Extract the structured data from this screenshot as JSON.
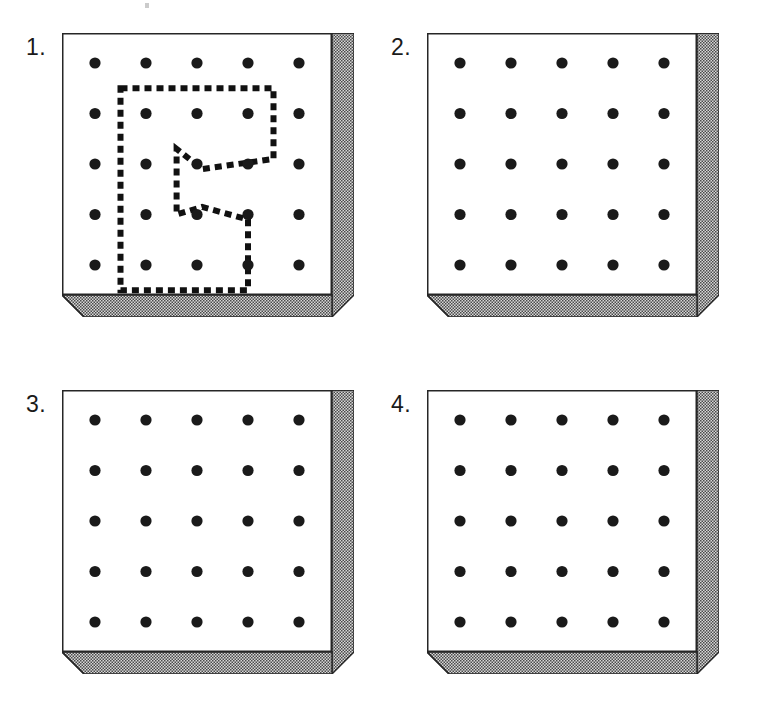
{
  "figure": {
    "kind": "pegboard-panel-set",
    "panel_count": 4,
    "grid": {
      "rows": 5,
      "columns": 5,
      "dot_count": 25,
      "dot_color": "#1a1a1a",
      "dot_radius_px": 5.6,
      "spacing_px": 55
    },
    "colors": {
      "ink": "#1a1a1a",
      "outline": "#262626",
      "face": "#ffffff",
      "edge_fill": "#d7d7d7",
      "edge_stipple": "#4a4a4a",
      "dash": "#111111",
      "speck": "#b9b9b9"
    },
    "board_geometry": {
      "face_width_px": 270,
      "face_height_px": 262,
      "depth_px": 22,
      "right_edge": "stippled parallelogram",
      "bottom_edge": "stippled parallelogram"
    }
  },
  "panels": [
    {
      "id": "panel-1",
      "label": "1.",
      "x": 62,
      "y": 33,
      "has_dashed_outline": true,
      "dashed_outline": {
        "style": "square dotted",
        "dash_length_px": 7,
        "gap_length_px": 5,
        "stroke_width_px": 6,
        "closed": true,
        "note": "Irregular closed region enclosing 12 pegs with a zig-zag re-entrant notch on its right-centre side.",
        "vertices_grid": [
          [
            0.5,
            0.5
          ],
          [
            3.5,
            0.5
          ],
          [
            3.5,
            1.9
          ],
          [
            2.1,
            2.1
          ],
          [
            1.6,
            1.7
          ],
          [
            1.6,
            3.0
          ],
          [
            2.1,
            2.85
          ],
          [
            3.0,
            3.1
          ],
          [
            3.0,
            4.5
          ],
          [
            0.5,
            4.5
          ]
        ]
      }
    },
    {
      "id": "panel-2",
      "label": "2.",
      "x": 427,
      "y": 33,
      "has_dashed_outline": false,
      "dashed_outline": null
    },
    {
      "id": "panel-3",
      "label": "3.",
      "x": 62,
      "y": 390,
      "has_dashed_outline": false,
      "dashed_outline": null
    },
    {
      "id": "panel-4",
      "label": "4.",
      "x": 427,
      "y": 390,
      "has_dashed_outline": false,
      "dashed_outline": null
    }
  ],
  "labels": {
    "panel_1": "1.",
    "panel_2": "2.",
    "panel_3": "3.",
    "panel_4": "4."
  },
  "artifacts": [
    {
      "name": "scan-speck-top",
      "x": 145,
      "y": 3,
      "w": 4,
      "h": 5
    }
  ]
}
